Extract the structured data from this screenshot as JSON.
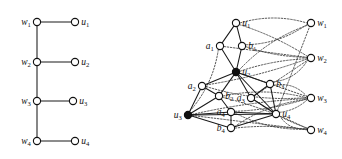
{
  "figure": {
    "background_color": "#ffffff",
    "ink_color": "#111111",
    "width": 342,
    "height": 159
  },
  "panels": [
    {
      "id": "left",
      "name": "left-graph",
      "description": "Caterpillar tree: path w1-w2-w3-w4 with pendant leaves u1..u4",
      "nodes": [
        {
          "id": "w1",
          "label": "w",
          "sub": "1",
          "x": 37,
          "y": 22,
          "style": "open",
          "label_pos": "left"
        },
        {
          "id": "w2",
          "label": "w",
          "sub": "2",
          "x": 37,
          "y": 62,
          "style": "open",
          "label_pos": "left"
        },
        {
          "id": "w3",
          "label": "w",
          "sub": "3",
          "x": 37,
          "y": 101,
          "style": "open",
          "label_pos": "left"
        },
        {
          "id": "w4",
          "label": "w",
          "sub": "4",
          "x": 37,
          "y": 141,
          "style": "open",
          "label_pos": "left"
        },
        {
          "id": "u1",
          "label": "u",
          "sub": "1",
          "x": 75,
          "y": 22,
          "style": "open",
          "label_pos": "right"
        },
        {
          "id": "u2",
          "label": "u",
          "sub": "2",
          "x": 75,
          "y": 62,
          "style": "open",
          "label_pos": "right"
        },
        {
          "id": "u3",
          "label": "u",
          "sub": "3",
          "x": 73,
          "y": 101,
          "style": "open",
          "label_pos": "right"
        },
        {
          "id": "u4",
          "label": "u",
          "sub": "4",
          "x": 75,
          "y": 141,
          "style": "open",
          "label_pos": "right"
        }
      ],
      "edges_solid": [
        [
          "w1",
          "w2"
        ],
        [
          "w2",
          "w3"
        ],
        [
          "w3",
          "w4"
        ],
        [
          "w1",
          "u1"
        ],
        [
          "w2",
          "u2"
        ],
        [
          "w3",
          "u3"
        ],
        [
          "w4",
          "u4"
        ]
      ],
      "edges_dotted": []
    },
    {
      "id": "right",
      "name": "right-graph",
      "description": "Dense graph with u, a, b vertices on the left cluster and w vertices on the right column",
      "nodes": [
        {
          "id": "u1",
          "label": "u",
          "sub": "1",
          "x": 65,
          "y": 23,
          "style": "open",
          "label_pos": "right"
        },
        {
          "id": "a1",
          "label": "a",
          "sub": "1",
          "x": 49,
          "y": 46,
          "style": "open",
          "label_pos": "left"
        },
        {
          "id": "b1",
          "label": "b",
          "sub": "1",
          "x": 71,
          "y": 46,
          "style": "open",
          "label_pos": "right"
        },
        {
          "id": "u2",
          "label": "u",
          "sub": "2",
          "x": 65,
          "y": 72,
          "style": "filled",
          "label_pos": "right"
        },
        {
          "id": "a2",
          "label": "a",
          "sub": "2",
          "x": 31,
          "y": 86,
          "style": "open",
          "label_pos": "left"
        },
        {
          "id": "b3",
          "label": "b",
          "sub": "3",
          "x": 99,
          "y": 84,
          "style": "open",
          "label_pos": "right"
        },
        {
          "id": "b2",
          "label": "b",
          "sub": "2",
          "x": 48,
          "y": 96,
          "style": "open",
          "label_pos": "right"
        },
        {
          "id": "a3",
          "label": "a",
          "sub": "3",
          "x": 80,
          "y": 98,
          "style": "open",
          "label_pos": "left"
        },
        {
          "id": "u3",
          "label": "u",
          "sub": "3",
          "x": 17,
          "y": 115,
          "style": "filled",
          "label_pos": "left"
        },
        {
          "id": "a4",
          "label": "a",
          "sub": "4",
          "x": 60,
          "y": 112,
          "style": "open",
          "label_pos": "left"
        },
        {
          "id": "u4",
          "label": "u",
          "sub": "4",
          "x": 105,
          "y": 114,
          "style": "open",
          "label_pos": "right"
        },
        {
          "id": "b4",
          "label": "b",
          "sub": "4",
          "x": 60,
          "y": 128,
          "style": "open",
          "label_pos": "left"
        },
        {
          "id": "w1",
          "label": "w",
          "sub": "1",
          "x": 140,
          "y": 23,
          "style": "open",
          "label_pos": "right"
        },
        {
          "id": "w2",
          "label": "w",
          "sub": "2",
          "x": 140,
          "y": 58,
          "style": "open",
          "label_pos": "right"
        },
        {
          "id": "w3",
          "label": "w",
          "sub": "3",
          "x": 140,
          "y": 98,
          "style": "open",
          "label_pos": "right"
        },
        {
          "id": "w4",
          "label": "w",
          "sub": "4",
          "x": 140,
          "y": 130,
          "style": "open",
          "label_pos": "right"
        }
      ],
      "edges_solid": [
        [
          "u1",
          "a1"
        ],
        [
          "u1",
          "b1"
        ],
        [
          "a1",
          "u2"
        ],
        [
          "b1",
          "u2"
        ],
        [
          "u2",
          "a2"
        ],
        [
          "u2",
          "b2"
        ],
        [
          "u2",
          "a3"
        ],
        [
          "u2",
          "b3"
        ],
        [
          "a2",
          "u3"
        ],
        [
          "a2",
          "b2"
        ],
        [
          "b2",
          "u3"
        ],
        [
          "b2",
          "a4"
        ],
        [
          "u3",
          "a4"
        ],
        [
          "u3",
          "b4"
        ],
        [
          "u3",
          "u4"
        ],
        [
          "a4",
          "u4"
        ],
        [
          "a4",
          "b4"
        ],
        [
          "b4",
          "u4"
        ],
        [
          "a3",
          "u4"
        ],
        [
          "b3",
          "u4"
        ],
        [
          "a3",
          "b3"
        ],
        [
          "u2",
          "u4"
        ]
      ],
      "edges_dotted": [
        [
          "u1",
          "w1"
        ],
        [
          "u1",
          "w2"
        ],
        [
          "a1",
          "w2"
        ],
        [
          "b1",
          "w2"
        ],
        [
          "b1",
          "w1"
        ],
        [
          "u2",
          "w1"
        ],
        [
          "u2",
          "w2"
        ],
        [
          "u2",
          "w3"
        ],
        [
          "a2",
          "w2"
        ],
        [
          "a2",
          "w3"
        ],
        [
          "b2",
          "w3"
        ],
        [
          "b2",
          "w4"
        ],
        [
          "a3",
          "w2"
        ],
        [
          "a3",
          "w4"
        ],
        [
          "b3",
          "w2"
        ],
        [
          "b3",
          "w3"
        ],
        [
          "u3",
          "w3"
        ],
        [
          "u3",
          "w4"
        ],
        [
          "a4",
          "w3"
        ],
        [
          "a4",
          "w4"
        ],
        [
          "b4",
          "w3"
        ],
        [
          "b4",
          "w4"
        ],
        [
          "u4",
          "w1"
        ],
        [
          "u4",
          "w3"
        ],
        [
          "u4",
          "w4"
        ],
        [
          "a1",
          "u3"
        ]
      ]
    }
  ]
}
